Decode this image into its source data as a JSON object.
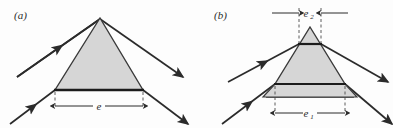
{
  "figure": {
    "background_color": "#fdfdfd",
    "ink_color": "#2b2b2b",
    "glass_fill_color": "#d6d6d6",
    "glass_stroke_color": "#3a3a3a",
    "base_line_color": "#1c1c1c",
    "dashed_color": "#4a4a4a"
  },
  "panels": [
    {
      "id": "panel-a",
      "label": "(a)",
      "label_x": 14,
      "label_y": 19,
      "description": "single prism with one beam aperture",
      "prism": {
        "apex_x": 100,
        "apex_y": 18,
        "base_left_x": 55,
        "base_right_x": 143,
        "base_y": 90
      },
      "dimensions": [
        {
          "name": "e",
          "label": "e",
          "subscript": "",
          "label_x": 99,
          "label_y": 110,
          "line_y": 106,
          "from_x": 55,
          "to_x": 143,
          "style": "outward-extension-dashed"
        }
      ],
      "rays": [
        {
          "name": "upper-incident-ray",
          "x1": 17,
          "y1": 77,
          "x2": 100,
          "y2": 19,
          "arrow": "midpoint"
        },
        {
          "name": "upper-exit-ray",
          "x1": 100,
          "y1": 19,
          "x2": 183,
          "y2": 77,
          "arrow": "end"
        },
        {
          "name": "lower-incident-ray",
          "x1": 10,
          "y1": 124,
          "x2": 55,
          "y2": 90,
          "arrow": "midpoint"
        },
        {
          "name": "lower-exit-ray",
          "x1": 143,
          "y1": 90,
          "x2": 188,
          "y2": 124,
          "arrow": "end"
        }
      ]
    },
    {
      "id": "panel-b",
      "label": "(b)",
      "label_x": 214,
      "label_y": 19,
      "description": "prism with two beam apertures e1 and e2",
      "prism": {
        "apex_x": 310,
        "apex_y": 27,
        "base_left_x": 267,
        "base_right_x": 353,
        "base_y": 97
      },
      "chords": [
        {
          "name": "upper-chord",
          "y": 44,
          "left_x": 299,
          "right_x": 321
        },
        {
          "name": "lower-chord",
          "y": 84,
          "left_x": 275,
          "right_x": 345
        }
      ],
      "slab": {
        "name": "lower-slab",
        "top_y": 84,
        "bottom_y": 97,
        "top_left_x": 275,
        "top_right_x": 345,
        "bottom_left_x": 263,
        "bottom_right_x": 357
      },
      "dimensions": [
        {
          "name": "e2",
          "label": "e",
          "subscript": "2",
          "label_x": 310,
          "label_y": 16,
          "line_y": 13,
          "from_x": 299,
          "to_x": 321,
          "style": "inward-arrows-dashed"
        },
        {
          "name": "e1",
          "label": "e",
          "subscript": "1",
          "label_x": 310,
          "label_y": 117,
          "line_y": 113,
          "from_x": 275,
          "to_x": 345,
          "style": "outward-extension-dashed"
        }
      ],
      "rays": [
        {
          "name": "upper-incident-ray",
          "x1": 228,
          "y1": 82,
          "x2": 299,
          "y2": 44,
          "arrow": "midpoint"
        },
        {
          "name": "upper-exit-ray",
          "x1": 321,
          "y1": 44,
          "x2": 388,
          "y2": 82,
          "arrow": "end"
        },
        {
          "name": "lower-incident-ray",
          "x1": 222,
          "y1": 124,
          "x2": 275,
          "y2": 84,
          "arrow": "midpoint"
        },
        {
          "name": "lower-exit-ray",
          "x1": 345,
          "y1": 84,
          "x2": 392,
          "y2": 124,
          "arrow": "end"
        }
      ]
    }
  ]
}
